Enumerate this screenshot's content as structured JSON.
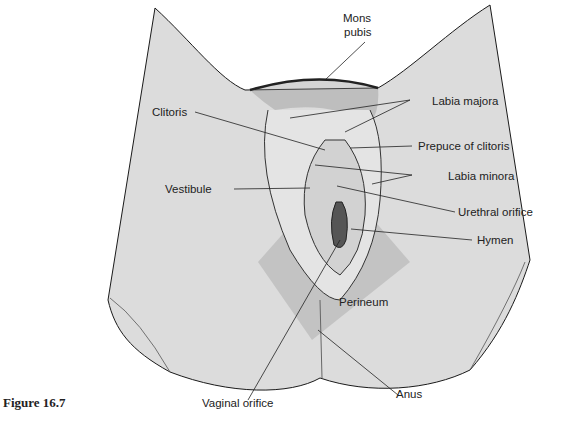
{
  "figure": {
    "caption": "Figure 16.7",
    "colors": {
      "skin": "#dcdcdc",
      "perineum": "#bdbdbd",
      "line": "#1a1a1a",
      "background": "#ffffff"
    }
  },
  "labels": {
    "mons_pubis_1": "Mons",
    "mons_pubis_2": "pubis",
    "clitoris": "Clitoris",
    "labia_majora": "Labia majora",
    "prepuce": "Prepuce of clitoris",
    "labia_minora": "Labia minora",
    "vestibule": "Vestibule",
    "urethral_orifice": "Urethral orifice",
    "hymen": "Hymen",
    "perineum": "Perineum",
    "vaginal_orifice": "Vaginal orifice",
    "anus": "Anus"
  }
}
